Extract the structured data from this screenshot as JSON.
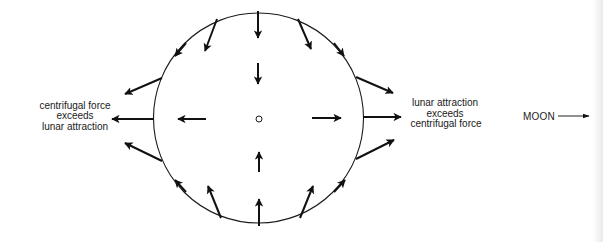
{
  "diagram": {
    "type": "tidal-forces",
    "left_label": {
      "lines": [
        "centrifugal force",
        "exceeds",
        "lunar attraction"
      ]
    },
    "right_label": {
      "lines": [
        "lunar attraction",
        "exceeds",
        "centrifugal force"
      ]
    },
    "moon_label": "MOON",
    "colors": {
      "ink": "#1a1a1a",
      "background": "#ffffff"
    }
  }
}
